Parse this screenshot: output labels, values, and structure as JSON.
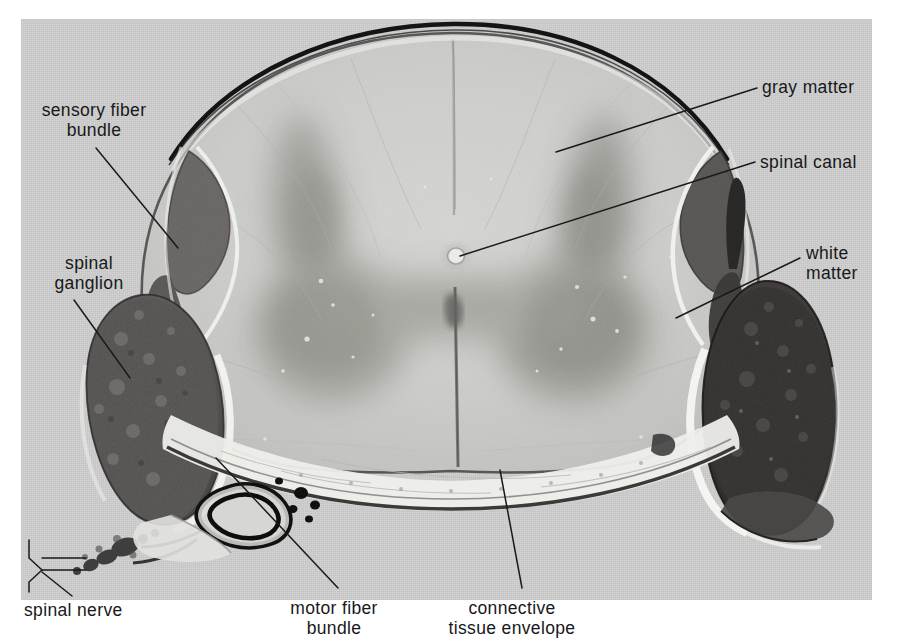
{
  "figure": {
    "kind": "histology-micrograph",
    "plate_background": "#d2d2d2",
    "label_color": "#17181a",
    "leader_color": "#1a1a1a"
  },
  "labels": {
    "sensory_fiber_bundle": "sensory fiber\nbundle",
    "spinal_ganglion": "spinal\nganglion",
    "spinal_nerve": "spinal nerve",
    "motor_fiber_bundle": "motor fiber\nbundle",
    "connective_tissue_envelope": "connective\ntissue envelope",
    "gray_matter": "gray matter",
    "spinal_canal": "spinal canal",
    "white_matter": "white\nmatter"
  },
  "annotation_count": 8,
  "annotations": [
    {
      "name": "sensory-fiber-bundle",
      "side": "left",
      "target_xy": [
        158,
        212
      ]
    },
    {
      "name": "spinal-ganglion",
      "side": "left",
      "target_xy": [
        105,
        355
      ]
    },
    {
      "name": "spinal-nerve",
      "side": "left",
      "target_xy": [
        60,
        545
      ]
    },
    {
      "name": "motor-fiber-bundle",
      "side": "bottom",
      "target_xy": [
        198,
        452
      ]
    },
    {
      "name": "connective-tissue",
      "side": "bottom",
      "target_xy": [
        508,
        462
      ]
    },
    {
      "name": "gray-matter",
      "side": "right",
      "target_xy": [
        560,
        148
      ]
    },
    {
      "name": "spinal-canal",
      "side": "right",
      "target_xy": [
        456,
        256
      ]
    },
    {
      "name": "white-matter",
      "side": "right",
      "target_xy": [
        672,
        317
      ]
    }
  ]
}
